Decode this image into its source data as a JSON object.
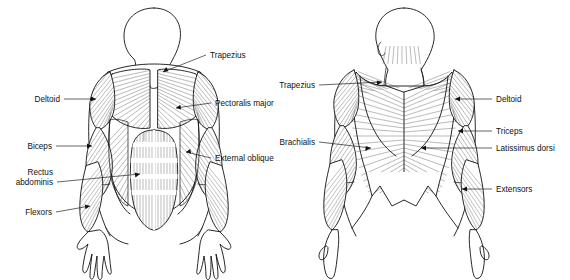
{
  "figure": {
    "background_color": "#ffffff",
    "line_color": "#111111",
    "views": [
      {
        "id": "anterior",
        "name": "Anterior (front) view"
      },
      {
        "id": "posterior",
        "name": "Posterior (back) view"
      }
    ]
  },
  "anterior_labels": {
    "deltoid": "Deltoid",
    "biceps": "Biceps",
    "rectus_abdominis_line1": "Rectus",
    "rectus_abdominis_line2": "abdominis",
    "flexors": "Flexors",
    "trapezius": "Trapezius",
    "pectoralis_major": "Pectoralis major",
    "external_oblique": "External oblique"
  },
  "posterior_labels": {
    "trapezius": "Trapezius",
    "brachialis": "Brachialis",
    "deltoid": "Deltoid",
    "triceps": "Triceps",
    "latissimus_dorsi": "Latissimus dorsi",
    "extensors": "Extensors"
  }
}
